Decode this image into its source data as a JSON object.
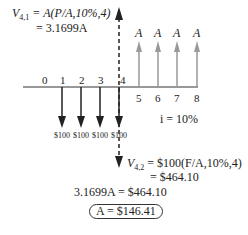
{
  "equations": {
    "v41_line1_prefix": "V",
    "v41_sub": "4,1",
    "v41_line1_rest": " = A(P/A,10%,4)",
    "v41_line2": "= 3.1699A",
    "v42_prefix": "V",
    "v42_sub": "4,2",
    "v42_line1_rest": " = $100(F/A,10%,4)",
    "v42_line2": "= $464.10",
    "equation3": "3.1699A = $464.10",
    "result": "A = $146.41"
  },
  "timeline": {
    "periods": [
      "0",
      "1",
      "2",
      "3",
      "4",
      "5",
      "6",
      "7",
      "8"
    ],
    "outflows": [
      {
        "period": "1",
        "label": "$100"
      },
      {
        "period": "2",
        "label": "$100"
      },
      {
        "period": "3",
        "label": "$100"
      },
      {
        "period": "4",
        "label": "$100"
      }
    ],
    "inflows": [
      {
        "period": "5",
        "label": "A"
      },
      {
        "period": "6",
        "label": "A"
      },
      {
        "period": "7",
        "label": "A"
      },
      {
        "period": "8",
        "label": "A"
      }
    ],
    "interest_rate": "i = 10%"
  },
  "colors": {
    "outflow_arrow": "#222222",
    "inflow_arrow": "#999999",
    "timeline": "#333333",
    "dashed_arrow": "#222222"
  }
}
